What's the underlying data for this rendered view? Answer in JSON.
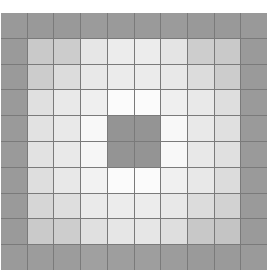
{
  "figure": {
    "name": "grid-heatmap",
    "background_color": "#ffffff",
    "gridline_color": "#7a7a7a"
  },
  "chart_data": {
    "type": "heatmap",
    "title": "",
    "subtitle": "",
    "xlabel": "",
    "ylabel": "",
    "rows": 10,
    "cols": 10,
    "grid": true,
    "legend": "none",
    "xticklabels": [],
    "yticklabels": [],
    "vmin": 0,
    "vmax": 4,
    "colorscale": [
      {
        "value": 0,
        "color": "#999999"
      },
      {
        "value": 1,
        "color": "#c4c4c4"
      },
      {
        "value": 2,
        "color": "#dedede"
      },
      {
        "value": 3,
        "color": "#eeeeee"
      },
      {
        "value": 4,
        "color": "#fbfbfb"
      }
    ],
    "values": [
      [
        0,
        0,
        0,
        0,
        0,
        0,
        0,
        0,
        0,
        0
      ],
      [
        0,
        1,
        1,
        2,
        3,
        3,
        2,
        1,
        1,
        0
      ],
      [
        0,
        1,
        2,
        3,
        3,
        3,
        3,
        2,
        1,
        0
      ],
      [
        0,
        2,
        3,
        3,
        4,
        4,
        3,
        3,
        2,
        0
      ],
      [
        0,
        2,
        3,
        4,
        0,
        0,
        4,
        3,
        2,
        0
      ],
      [
        0,
        2,
        3,
        4,
        0,
        0,
        4,
        3,
        2,
        0
      ],
      [
        0,
        2,
        3,
        3,
        4,
        4,
        3,
        3,
        2,
        0
      ],
      [
        0,
        1,
        2,
        3,
        3,
        3,
        3,
        2,
        1,
        0
      ],
      [
        0,
        1,
        1,
        2,
        3,
        3,
        2,
        1,
        1,
        0
      ],
      [
        0,
        0,
        0,
        0,
        0,
        0,
        0,
        0,
        0,
        0
      ]
    ],
    "colors": [
      [
        "#999999",
        "#999999",
        "#999999",
        "#9b9b9b",
        "#9a9a9a",
        "#9a9a9a",
        "#9b9b9b",
        "#999999",
        "#999999",
        "#999999"
      ],
      [
        "#9a9a9a",
        "#c9c9c9",
        "#cccccc",
        "#e6e6e6",
        "#ececec",
        "#ececec",
        "#e4e4e4",
        "#cdcdcd",
        "#c9c9c9",
        "#9a9a9a"
      ],
      [
        "#9a9a9a",
        "#cccccc",
        "#dcdcdc",
        "#e8e8e8",
        "#ebebeb",
        "#ebebeb",
        "#e8e8e8",
        "#dcdcdc",
        "#cccccc",
        "#9a9a9a"
      ],
      [
        "#9a9a9a",
        "#e0e0e0",
        "#e9e9e9",
        "#efefef",
        "#fbfbfb",
        "#fbfbfb",
        "#efefef",
        "#e9e9e9",
        "#dedede",
        "#9a9a9a"
      ],
      [
        "#9a9a9a",
        "#e2e2e2",
        "#e9e9e9",
        "#f8f8f8",
        "#949494",
        "#949494",
        "#f8f8f8",
        "#e9e9e9",
        "#e0e0e0",
        "#9a9a9a"
      ],
      [
        "#9a9a9a",
        "#e2e2e2",
        "#e9e9e9",
        "#f6f6f6",
        "#949494",
        "#949494",
        "#f8f8f8",
        "#e8e8e8",
        "#e0e0e0",
        "#9a9a9a"
      ],
      [
        "#9a9a9a",
        "#dedede",
        "#e8e8e8",
        "#f2f2f2",
        "#fbfbfb",
        "#fbfbfb",
        "#f0f0f0",
        "#e8e8e8",
        "#dcdcdc",
        "#9a9a9a"
      ],
      [
        "#9a9a9a",
        "#d6d6d6",
        "#dedede",
        "#eaeaea",
        "#ececec",
        "#ececec",
        "#e8e8e8",
        "#dcdcdc",
        "#d2d2d2",
        "#9a9a9a"
      ],
      [
        "#9a9a9a",
        "#cacaca",
        "#cdcdcd",
        "#e0e0e0",
        "#e6e6e6",
        "#e6e6e6",
        "#dedede",
        "#c8c8c8",
        "#c4c4c4",
        "#9a9a9a"
      ],
      [
        "#9a9a9a",
        "#9c9c9c",
        "#9c9c9c",
        "#a0a0a0",
        "#9e9e9e",
        "#9e9e9e",
        "#9c9c9c",
        "#9a9a9a",
        "#9a9a9a",
        "#9a9a9a"
      ]
    ],
    "annotations": [
      {
        "name": "center-dark-block",
        "row_range": [
          4,
          5
        ],
        "col_range": [
          4,
          5
        ],
        "color": "#949494"
      }
    ]
  }
}
